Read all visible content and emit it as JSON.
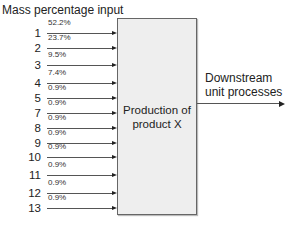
{
  "diagram": {
    "title": "Mass percentage input",
    "process_box": {
      "label_line1": "Production of",
      "label_line2": "product X"
    },
    "output": {
      "label_line1": "Downstream",
      "label_line2": "unit processes"
    },
    "inputs": [
      {
        "id": "1",
        "pct": "52.2%",
        "y": 25
      },
      {
        "id": "2",
        "pct": "23.7%",
        "y": 40
      },
      {
        "id": "3",
        "pct": "9.5%",
        "y": 57
      },
      {
        "id": "4",
        "pct": "7.4%",
        "y": 75
      },
      {
        "id": "5",
        "pct": "0.9%",
        "y": 90
      },
      {
        "id": "7",
        "pct": "0.9%",
        "y": 105
      },
      {
        "id": "8",
        "pct": "0.9%",
        "y": 120
      },
      {
        "id": "9",
        "pct": "0.9%",
        "y": 135
      },
      {
        "id": "10",
        "pct": "0.9%",
        "y": 149
      },
      {
        "id": "11",
        "pct": "0.9%",
        "y": 167
      },
      {
        "id": "12",
        "pct": "0.9%",
        "y": 185
      },
      {
        "id": "13",
        "pct": "0.9%",
        "y": 200
      }
    ]
  }
}
